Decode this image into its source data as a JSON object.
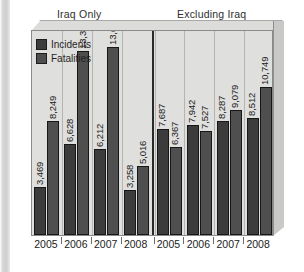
{
  "figure": {
    "source_label": "U.S. National Counterterrorism Center (NCTC 2009).",
    "group_titles": {
      "left": "Iraq Only",
      "right": "Excluding Iraq"
    },
    "colors": {
      "incidents": "#3c3c3c",
      "fatalities": "#4f4f4f",
      "plot_background": "#dfdfdd",
      "frame": "#8a8a88",
      "divider": "#2a2a2a"
    }
  },
  "chart_data": {
    "type": "bar",
    "title": "",
    "subtitle": "",
    "xlabel": "",
    "ylabel": "U.S. National Counterterrorism Center (NCTC 2009).",
    "grid": false,
    "legend_position": "top-left",
    "ylim": [
      0,
      14500
    ],
    "panels": [
      {
        "name": "Iraq Only",
        "categories": [
          "2005",
          "2006",
          "2007",
          "2008"
        ],
        "series": [
          {
            "name": "Incidents",
            "values": [
              3469,
              6628,
              6212,
              3258
            ],
            "labels": [
              "3,469",
              "6,628",
              "6,212",
              "3,258"
            ]
          },
          {
            "name": "Fatalities",
            "values": [
              8249,
              13345,
              13606,
              5016
            ],
            "labels": [
              "8,249",
              "13,345",
              "13,606",
              "5,016"
            ]
          }
        ]
      },
      {
        "name": "Excluding Iraq",
        "categories": [
          "2005",
          "2006",
          "2007",
          "2008"
        ],
        "series": [
          {
            "name": "Incidents",
            "values": [
              7687,
              7942,
              8287,
              8512
            ],
            "labels": [
              "7,687",
              "7,942",
              "8,287",
              "8,512"
            ]
          },
          {
            "name": "Fatalities",
            "values": [
              6367,
              7527,
              9079,
              10749
            ],
            "labels": [
              "6,367",
              "7,527",
              "9,079",
              "10,749"
            ]
          }
        ]
      }
    ],
    "legend": [
      {
        "label": "Incidents",
        "color": "#3c3c3c"
      },
      {
        "label": "Fatalities",
        "color": "#4f4f4f"
      }
    ]
  },
  "legend": {
    "items": [
      {
        "label": "Incidents"
      },
      {
        "label": "Fatalities"
      }
    ]
  }
}
